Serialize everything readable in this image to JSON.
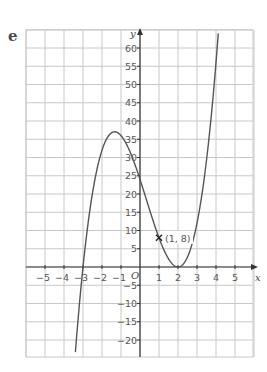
{
  "part_label": "e",
  "chart_data": {
    "type": "line",
    "title": "",
    "xlabel": "x",
    "ylabel": "y",
    "origin_label": "O",
    "function": "y = 2(x - 2)^2 (x + 3)",
    "xlim": [
      -6,
      6
    ],
    "ylim": [
      -25,
      65
    ],
    "x_ticks": [
      -5,
      -4,
      -3,
      -2,
      -1,
      1,
      2,
      3,
      4,
      5
    ],
    "x_tick_labels": [
      "−5",
      "−4",
      "−3",
      "−2",
      "−1",
      "1",
      "2",
      "3",
      "4",
      "5"
    ],
    "y_ticks": [
      -20,
      -15,
      -10,
      -5,
      5,
      10,
      15,
      20,
      25,
      30,
      35,
      40,
      45,
      50,
      55,
      60
    ],
    "y_tick_labels": [
      "−20",
      "−15",
      "−10",
      "−5",
      "5",
      "10",
      "15",
      "20",
      "25",
      "30",
      "35",
      "40",
      "45",
      "50",
      "55",
      "60"
    ],
    "grid": true,
    "key_points": [
      {
        "x": -3,
        "y": 0,
        "note": "x-intercept"
      },
      {
        "x": 0,
        "y": 24,
        "note": "y-intercept"
      },
      {
        "x": -1.33,
        "y": 37,
        "note": "local maximum"
      },
      {
        "x": 2,
        "y": 0,
        "note": "local minimum / touches x-axis"
      }
    ],
    "annotations": [
      {
        "x": 1,
        "y": 8,
        "marker": "cross",
        "text": "(1, 8)"
      }
    ],
    "colors": {
      "curve": "#555555",
      "grid": "#c8c8c8",
      "axis": "#333333"
    }
  }
}
